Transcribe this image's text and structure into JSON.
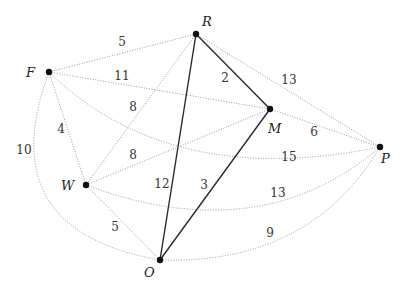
{
  "graph": {
    "nodes": [
      {
        "id": "R",
        "label": "R",
        "x": 196,
        "y": 34,
        "lx": 202,
        "ly": 26
      },
      {
        "id": "F",
        "label": "F",
        "x": 49,
        "y": 72,
        "lx": 26,
        "ly": 77
      },
      {
        "id": "M",
        "label": "M",
        "x": 270,
        "y": 109,
        "lx": 268,
        "ly": 133
      },
      {
        "id": "P",
        "label": "P",
        "x": 380,
        "y": 147,
        "lx": 381,
        "ly": 163
      },
      {
        "id": "W",
        "label": "W",
        "x": 86,
        "y": 185,
        "lx": 61,
        "ly": 190
      },
      {
        "id": "O",
        "label": "O",
        "x": 160,
        "y": 260,
        "lx": 144,
        "ly": 277
      }
    ],
    "edges": [
      {
        "from": "F",
        "to": "R",
        "weight": "5",
        "style": "dotted",
        "path": "M49,72 L196,34",
        "wx": 122,
        "wy": 46
      },
      {
        "from": "F",
        "to": "M",
        "weight": "11",
        "style": "dotted",
        "path": "M49,72 L270,109",
        "wx": 122,
        "wy": 80
      },
      {
        "from": "F",
        "to": "P",
        "weight": "15",
        "style": "dotted",
        "path": "M49,72 Q170,190 380,147",
        "wx": 289,
        "wy": 161
      },
      {
        "from": "F",
        "to": "W",
        "weight": "4",
        "style": "dotted",
        "path": "M49,72 L86,185",
        "wx": 61,
        "wy": 133
      },
      {
        "from": "F",
        "to": "O",
        "weight": "10",
        "style": "dotted",
        "path": "M49,72 Q-10,230 160,260",
        "wx": 24,
        "wy": 154
      },
      {
        "from": "R",
        "to": "M",
        "weight": "2",
        "style": "solid",
        "path": "M196,34 L270,109",
        "wx": 225,
        "wy": 82
      },
      {
        "from": "R",
        "to": "P",
        "weight": "13",
        "style": "dotted",
        "path": "M196,34 L380,147",
        "wx": 289,
        "wy": 84
      },
      {
        "from": "R",
        "to": "W",
        "weight": "8",
        "style": "dotted",
        "path": "M196,34 L86,185",
        "wx": 133,
        "wy": 111
      },
      {
        "from": "R",
        "to": "O",
        "weight": "12",
        "style": "solid",
        "path": "M196,34 L160,260",
        "wx": 162,
        "wy": 188
      },
      {
        "from": "M",
        "to": "P",
        "weight": "6",
        "style": "dotted",
        "path": "M270,109 L380,147",
        "wx": 314,
        "wy": 136
      },
      {
        "from": "M",
        "to": "W",
        "weight": "8",
        "style": "dotted",
        "path": "M270,109 L86,185",
        "wx": 133,
        "wy": 159
      },
      {
        "from": "M",
        "to": "O",
        "weight": "3",
        "style": "solid",
        "path": "M270,109 L160,260",
        "wx": 204,
        "wy": 189
      },
      {
        "from": "W",
        "to": "O",
        "weight": "5",
        "style": "dotted",
        "path": "M86,185 L160,260",
        "wx": 115,
        "wy": 231
      },
      {
        "from": "W",
        "to": "P",
        "weight": "13",
        "style": "dotted",
        "path": "M86,185 Q260,250 380,147",
        "wx": 278,
        "wy": 197
      },
      {
        "from": "O",
        "to": "P",
        "weight": "9",
        "style": "dotted",
        "path": "M160,260 Q310,265 380,147",
        "wx": 270,
        "wy": 237
      }
    ]
  }
}
